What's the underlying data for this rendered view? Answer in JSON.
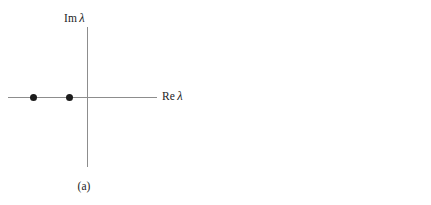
{
  "figure": {
    "axis_color": "#8d8d8d",
    "dot_color": "#1c1c1c",
    "background": "#ffffff"
  },
  "panels": [
    {
      "id": "a",
      "caption": "(a)",
      "imaginary_axis_label": "Im",
      "real_axis_label": "Re",
      "lambda_symbol": "λ",
      "points": [
        {
          "name": "eigenvalue-1",
          "re": -2.2,
          "im": 0.0
        },
        {
          "name": "eigenvalue-2",
          "re": -0.6,
          "im": 0.0
        }
      ]
    },
    {
      "id": "b",
      "caption": "(b)",
      "imaginary_axis_label": "Im",
      "real_axis_label": "Re",
      "lambda_symbol": "λ",
      "points": [
        {
          "name": "eigenvalue-1",
          "re": -0.7,
          "im": 1.2
        },
        {
          "name": "eigenvalue-2",
          "re": -0.7,
          "im": -1.2
        }
      ]
    }
  ],
  "chart_data": {
    "type": "scatter",
    "xlabel": "Re λ",
    "ylabel": "Im λ",
    "grid": false,
    "legend": false,
    "subplots": [
      {
        "label": "(a)",
        "xlim": [
          -2.7,
          2.4
        ],
        "ylim": [
          -2.3,
          2.3
        ],
        "x": [
          -2.2,
          -0.6
        ],
        "y": [
          0.0,
          0.0
        ]
      },
      {
        "label": "(b)",
        "xlim": [
          -2.7,
          2.4
        ],
        "ylim": [
          -2.3,
          2.3
        ],
        "x": [
          -0.7,
          -0.7
        ],
        "y": [
          1.2,
          -1.2
        ]
      }
    ]
  }
}
